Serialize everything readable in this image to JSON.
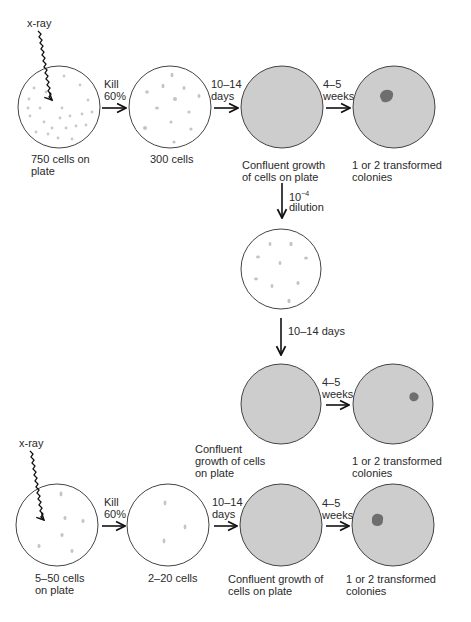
{
  "colors": {
    "plate_fill_empty": "#ffffff",
    "plate_fill_confluent": "#cdcdcd",
    "plate_stroke": "#444444",
    "cell": "#c4c4c4",
    "colony": "#6e6e6e",
    "arrow": "#111111"
  },
  "row1": {
    "xray_label": "x-ray",
    "step1_top": "Kill",
    "step1_bottom": "60%",
    "step2_top": "10–14",
    "step2_bottom": "days",
    "step3_top": "4–5",
    "step3_bottom": "weeks",
    "plate1_caption_1": "750 cells on",
    "plate1_caption_2": "plate",
    "plate2_caption": "300 cells",
    "plate3_caption_1": "Confluent growth",
    "plate3_caption_2": "of cells on plate",
    "plate4_caption_1": "1 or 2 transformed",
    "plate4_caption_2": "colonies"
  },
  "dilution": {
    "base": "10",
    "exponent": "−4",
    "label": "dilution"
  },
  "middle": {
    "down_step": "10–14 days",
    "step_top": "4–5",
    "step_bottom": "weeks",
    "confluent_caption_1": "Confluent",
    "confluent_caption_2": "growth of cells",
    "confluent_caption_3": "on plate",
    "colonies_caption_1": "1 or 2 transformed",
    "colonies_caption_2": "colonies"
  },
  "row3": {
    "xray_label": "x-ray",
    "step1_top": "Kill",
    "step1_bottom": "60%",
    "step2_top": "10–14",
    "step2_bottom": "days",
    "step3_top": "4–5",
    "step3_bottom": "weeks",
    "plate1_caption_1": "5–50 cells",
    "plate1_caption_2": "on plate",
    "plate2_caption": "2–20 cells",
    "plate3_caption_1": "Confluent growth of",
    "plate3_caption_2": "cells on plate",
    "plate4_caption_1": "1 or 2 transformed",
    "plate4_caption_2": "colonies"
  }
}
